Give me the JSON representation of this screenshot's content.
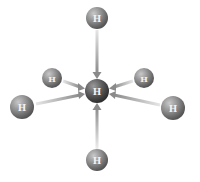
{
  "diagram": {
    "type": "molecular-interaction",
    "center": {
      "label": "H",
      "x": 97,
      "y": 91,
      "r": 12
    },
    "neighbors": [
      {
        "id": "top",
        "label": "H",
        "x": 97,
        "y": 18,
        "r": 11
      },
      {
        "id": "upper-left",
        "label": "H",
        "x": 52,
        "y": 78,
        "r": 10
      },
      {
        "id": "upper-right",
        "label": "H",
        "x": 144,
        "y": 78,
        "r": 10
      },
      {
        "id": "lower-left",
        "label": "H",
        "x": 22,
        "y": 107,
        "r": 12
      },
      {
        "id": "lower-right",
        "label": "H",
        "x": 173,
        "y": 108,
        "r": 12
      },
      {
        "id": "bottom",
        "label": "H",
        "x": 97,
        "y": 160,
        "r": 11
      }
    ],
    "colors": {
      "atom_light": "#b5b5b5",
      "atom_dark": "#5a5a5a",
      "center_dark": "#3a3a3a",
      "arrow": "#9a9a9a",
      "label": "#f2f2f2"
    }
  }
}
